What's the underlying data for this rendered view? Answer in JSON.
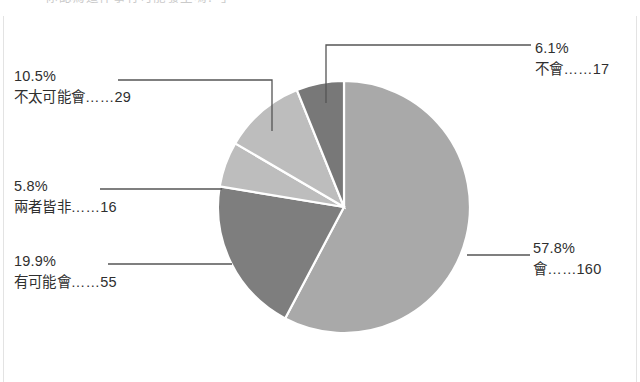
{
  "figure": {
    "top_cropped_text": "一「你認為這件事有可能發生嗎？」",
    "background_color": "#ffffff",
    "leader_line_color": "#555555",
    "slice_border_color": "#ffffff"
  },
  "chart_data": {
    "type": "pie",
    "title": "",
    "xlabel": "",
    "ylabel": "",
    "legend_position": "callouts",
    "grid": false,
    "total": 277,
    "start_angle_deg": 0,
    "direction": "clockwise",
    "categories": [
      "會",
      "有可能會",
      "兩者皆非",
      "不太可能會",
      "不會"
    ],
    "values": [
      160,
      55,
      16,
      29,
      17
    ],
    "percentages": [
      57.8,
      19.9,
      5.8,
      10.5,
      6.1
    ],
    "colors": [
      "#a9a9a9",
      "#7e7e7e",
      "#bdbdbd",
      "#bdbdbd",
      "#787878"
    ],
    "slices": [
      {
        "label": "會",
        "count": 160,
        "percent": 57.8,
        "percent_text": "57.8%",
        "count_text": "會……160",
        "color": "#a9a9a9"
      },
      {
        "label": "有可能會",
        "count": 55,
        "percent": 19.9,
        "percent_text": "19.9%",
        "count_text": "有可能會……55",
        "color": "#7e7e7e"
      },
      {
        "label": "兩者皆非",
        "count": 16,
        "percent": 5.8,
        "percent_text": "5.8%",
        "count_text": "兩者皆非……16",
        "color": "#bdbdbd"
      },
      {
        "label": "不太可能會",
        "count": 29,
        "percent": 10.5,
        "percent_text": "10.5%",
        "count_text": "不太可能會……29",
        "color": "#bdbdbd"
      },
      {
        "label": "不會",
        "count": 17,
        "percent": 6.1,
        "percent_text": "6.1%",
        "count_text": "不會……17",
        "color": "#787878"
      }
    ]
  }
}
